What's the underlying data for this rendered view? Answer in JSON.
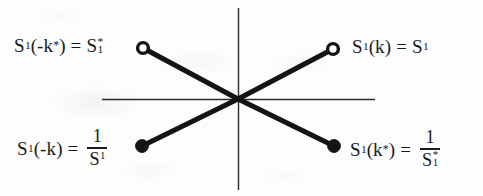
{
  "figure": {
    "name": "s-parameter-symmetry-diagram",
    "background_color": "#fdfdfd",
    "ink_color": "#1a1a1a"
  },
  "axes": {
    "horizontal": {
      "name": "horizontal-axis",
      "x1": 102,
      "y1": 99,
      "x2": 375,
      "y2": 99,
      "thickness": 1
    },
    "vertical": {
      "name": "vertical-axis",
      "x1": 238,
      "y1": 8,
      "x2": 238,
      "y2": 190,
      "thickness": 1
    },
    "origin": {
      "x": 238,
      "y": 99
    }
  },
  "segments": [
    {
      "name": "segment-upper-left-to-origin",
      "x1": 143,
      "y1": 48,
      "x2": 238,
      "y2": 99,
      "thickness": 5
    },
    {
      "name": "segment-origin-to-upper-right",
      "x1": 238,
      "y1": 99,
      "x2": 333,
      "y2": 49,
      "thickness": 5
    },
    {
      "name": "segment-lower-left-to-origin",
      "x1": 142,
      "y1": 146,
      "x2": 238,
      "y2": 99,
      "thickness": 5
    },
    {
      "name": "segment-origin-to-lower-right",
      "x1": 238,
      "y1": 99,
      "x2": 334,
      "y2": 146,
      "thickness": 5
    }
  ],
  "markers": [
    {
      "name": "marker-open-upper-left",
      "style": "open",
      "x": 143,
      "y": 48,
      "r": 5.5
    },
    {
      "name": "marker-open-upper-right",
      "style": "open",
      "x": 333,
      "y": 49,
      "r": 5.5
    },
    {
      "name": "marker-filled-lower-left",
      "style": "filled",
      "x": 142,
      "y": 146,
      "r": 6.0
    },
    {
      "name": "marker-filled-lower-right",
      "style": "filled",
      "x": 334,
      "y": 146,
      "r": 6.0
    }
  ],
  "labels": {
    "top_left": {
      "text": "S₁(-k*) = S₁*",
      "lhs_s": "S",
      "lhs_sub": "1",
      "lhs_arg_open": "(-k",
      "lhs_arg_star": "*",
      "lhs_arg_close": ")",
      "equals": "=",
      "rhs_s": "S",
      "rhs_star": "*",
      "rhs_sub": "1"
    },
    "top_right": {
      "text": "S₁(k) = S₁",
      "lhs_s": "S",
      "lhs_sub": "1",
      "lhs_arg": "(k)",
      "equals": "=",
      "rhs_s": "S",
      "rhs_sub": "1"
    },
    "bottom_left": {
      "text": "S₁(-k) = 1/S₁",
      "lhs_s": "S",
      "lhs_sub": "1",
      "lhs_arg": "(-k)",
      "equals": "=",
      "numerator": "1",
      "den_s": "S",
      "den_sub": "1"
    },
    "bottom_right": {
      "text": "S₁(k*) = 1/S₁*",
      "lhs_s": "S",
      "lhs_sub": "1",
      "lhs_arg_open": "(k",
      "lhs_arg_star": "*",
      "lhs_arg_close": ")",
      "equals": "=",
      "numerator": "1",
      "den_s": "S",
      "den_star": "*",
      "den_sub": "1"
    }
  }
}
